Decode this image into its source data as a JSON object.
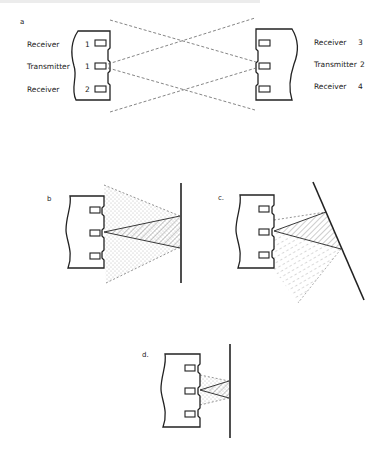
{
  "header_fragment": "",
  "panels": {
    "a": {
      "label": "a",
      "left_sensor": {
        "labels": [
          "Receiver",
          "Transmitter",
          "Receiver"
        ],
        "numbers": [
          "1",
          "1",
          "2"
        ]
      },
      "right_sensor": {
        "labels": [
          "Receiver",
          "Transmitter",
          "Receiver"
        ],
        "numbers": [
          "3",
          "2",
          "4"
        ]
      }
    },
    "b": {
      "label": "b"
    },
    "c": {
      "label": "c."
    },
    "d": {
      "label": "d."
    }
  },
  "colors": {
    "ink": "#222222",
    "dash": "#666666",
    "background": "#ffffff"
  }
}
